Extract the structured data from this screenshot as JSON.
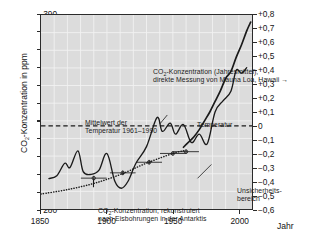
{
  "chart_data": {
    "type": "line",
    "title": "",
    "xlabel": "Jahr",
    "ylabel": "CO2-Konzentration in ppm",
    "ylabel_right": "Temperaturdifferenz in Kelvin zum Mittelwert 1961-1990",
    "xlim": [
      1850,
      2010
    ],
    "ylim": [
      280,
      390
    ],
    "ylim_right": [
      -0.6,
      0.8
    ],
    "grid": true,
    "legend": "annotations-inline",
    "xticks": [
      "1850",
      "1900",
      "1950",
      "2000"
    ],
    "xtick_values": [
      1850,
      1900,
      1950,
      2000
    ],
    "yticks_left": [
      "280",
      "290",
      "300",
      "310",
      "320",
      "330",
      "340",
      "350",
      "360",
      "370",
      "380",
      "390"
    ],
    "ytick_values_left": [
      280,
      290,
      300,
      310,
      320,
      330,
      340,
      350,
      360,
      370,
      380,
      390
    ],
    "yticks_right": [
      "−0,6",
      "−0,5",
      "−0,4",
      "−0,3",
      "−0,2",
      "−0,1",
      "0",
      "+0,1",
      "+0,2",
      "+0,3",
      "+0,4",
      "+0,5",
      "+0,6",
      "+0,7",
      "+0,8"
    ],
    "ytick_values_right": [
      -0.6,
      -0.5,
      -0.4,
      -0.3,
      -0.2,
      -0.1,
      0,
      0.1,
      0.2,
      0.3,
      0.4,
      0.5,
      0.6,
      0.7,
      0.8
    ],
    "reference_line": {
      "label": "Mittelwert der Temperatur 1961–1990",
      "value_kelvin": 0,
      "style": "dashed"
    },
    "series": [
      {
        "name": "CO2-Konzentration (Jahresmittel), direkte Messung von Mauna Loa, Hawaii",
        "axis": "left",
        "style": "solid",
        "x": [
          1958,
          1962,
          1966,
          1970,
          1974,
          1978,
          1982,
          1986,
          1990,
          1994,
          1998,
          2002,
          2006,
          2009
        ],
        "values": [
          315,
          318,
          321,
          325,
          330,
          335,
          341,
          347,
          354,
          358,
          366,
          373,
          381,
          386
        ]
      },
      {
        "name": "CO2-Konzentration, rekonstruiert nach Eisbohrungen in der Antarktis",
        "axis": "left",
        "style": "dotted",
        "x": [
          1850,
          1870,
          1890,
          1910,
          1930,
          1950,
          1958
        ],
        "values": [
          288.5,
          291,
          294.5,
          299.5,
          306,
          311.5,
          313
        ]
      },
      {
        "name": "Temperatur",
        "axis": "right",
        "style": "solid",
        "x": [
          1856,
          1862,
          1868,
          1872,
          1878,
          1882,
          1888,
          1894,
          1900,
          1906,
          1911,
          1916,
          1922,
          1930,
          1938,
          1942,
          1948,
          1952,
          1958,
          1964,
          1970,
          1976,
          1982,
          1988,
          1994,
          1998,
          2002,
          2006
        ],
        "values": [
          -0.38,
          -0.36,
          -0.27,
          -0.3,
          -0.18,
          -0.33,
          -0.35,
          -0.32,
          -0.2,
          -0.4,
          -0.45,
          -0.4,
          -0.27,
          -0.15,
          0.06,
          -0.04,
          0.02,
          -0.06,
          0.01,
          -0.12,
          -0.06,
          -0.13,
          0.1,
          0.18,
          0.25,
          0.4,
          0.38,
          0.42
        ]
      }
    ],
    "uncertainty_markers": {
      "label": "Unsicherheits-bereich",
      "points": [
        {
          "year": 1890,
          "value": 297.5
        },
        {
          "year": 1912,
          "value": 300.5
        },
        {
          "year": 1932,
          "value": 306.5
        },
        {
          "year": 1950,
          "value": 311.5
        },
        {
          "year": 1960,
          "value": 312.5
        }
      ]
    }
  },
  "axes": {
    "y_left_title": "CO",
    "y_left_title_sub": "2",
    "y_left_title_rest": "-Konzentration in ppm",
    "y_right_title_line1": "Temperaturdifferenz in Kelvin",
    "y_right_title_line2": "zum Mittelwert 1961–1990",
    "x_title": "Jahr"
  },
  "annotations": {
    "mauna_loa_line1_pre": "CO",
    "mauna_loa_line1_sub": "2",
    "mauna_loa_line1_post": "-Konzentration (Jahresmittel),",
    "mauna_loa_line2": "direkte Messung von Mauna Loa, Hawaii  →",
    "mittelwert_line1": "Mittelwert der",
    "mittelwert_line2": "Temperatur 1961–1990",
    "temperatur": "Temperatur",
    "eisbohrung_line1_pre": "CO",
    "eisbohrung_line1_sub": "2",
    "eisbohrung_line1_post": "-Konzentration, rekonstruiert",
    "eisbohrung_line2": "nach Eisbohrungen in der Antarktis",
    "unsicher_line1": "Unsicherheits-",
    "unsicher_line2": "bereich"
  },
  "colors": {
    "plot_background": "#dcdcdc",
    "grid": "#f2f2f2",
    "axis": "#2b2b2b",
    "data_line": "#1a1a1a",
    "page_background": "#ffffff"
  }
}
